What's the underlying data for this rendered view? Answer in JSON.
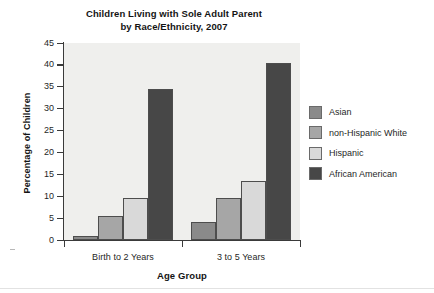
{
  "chart_data": {
    "type": "bar",
    "title": "Children Living with Sole Adult Parent by Race/Ethnicity, 2007",
    "title_line1": "Children Living with Sole Adult Parent",
    "title_line2": "by Race/Ethnicity, 2007",
    "xlabel": "Age Group",
    "ylabel": "Percentage of Children",
    "categories": [
      "Birth to 2 Years",
      "3 to 5 Years"
    ],
    "ylim": [
      0,
      45
    ],
    "ytick_step": 5,
    "ytick_labels": [
      "45",
      "40",
      "35",
      "30",
      "25",
      "20",
      "15",
      "10",
      "5",
      "0"
    ],
    "ytick_values": [
      45,
      40,
      35,
      30,
      25,
      20,
      15,
      10,
      5,
      0
    ],
    "grid": false,
    "legend_position": "right",
    "series": [
      {
        "name": "Asian",
        "color": "#8a8a8a",
        "values": [
          1,
          4
        ]
      },
      {
        "name": "non-Hispanic White",
        "color": "#a6a6a6",
        "values": [
          5.5,
          9.5
        ]
      },
      {
        "name": "Hispanic",
        "color": "#d9d9d9",
        "values": [
          9.5,
          13.5
        ]
      },
      {
        "name": "African American",
        "color": "#474747",
        "values": [
          34.5,
          40.5
        ]
      }
    ]
  },
  "legend": {
    "items": [
      {
        "label": "Asian"
      },
      {
        "label": "non-Hispanic White"
      },
      {
        "label": "Hispanic"
      },
      {
        "label": "African American"
      }
    ]
  },
  "colors": {
    "plot_background": "#efefed",
    "page_background": "#ffffff",
    "axis": "#3a3a3a",
    "text": "#1f1f1f"
  }
}
